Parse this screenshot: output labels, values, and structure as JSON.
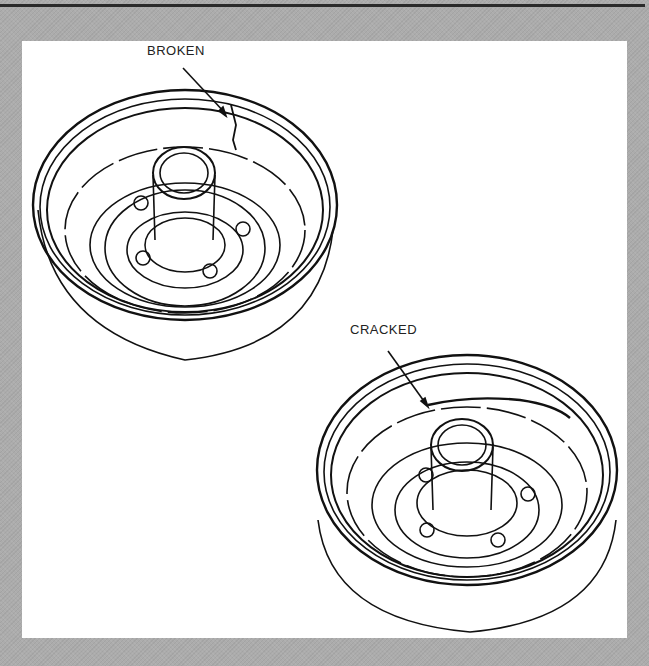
{
  "figure": {
    "callouts": [
      {
        "id": "broken",
        "label": "BROKEN"
      },
      {
        "id": "cracked",
        "label": "CRACKED"
      }
    ],
    "colors": {
      "frame": "#acacac",
      "panel": "#ffffff",
      "ink": "#111111"
    }
  }
}
